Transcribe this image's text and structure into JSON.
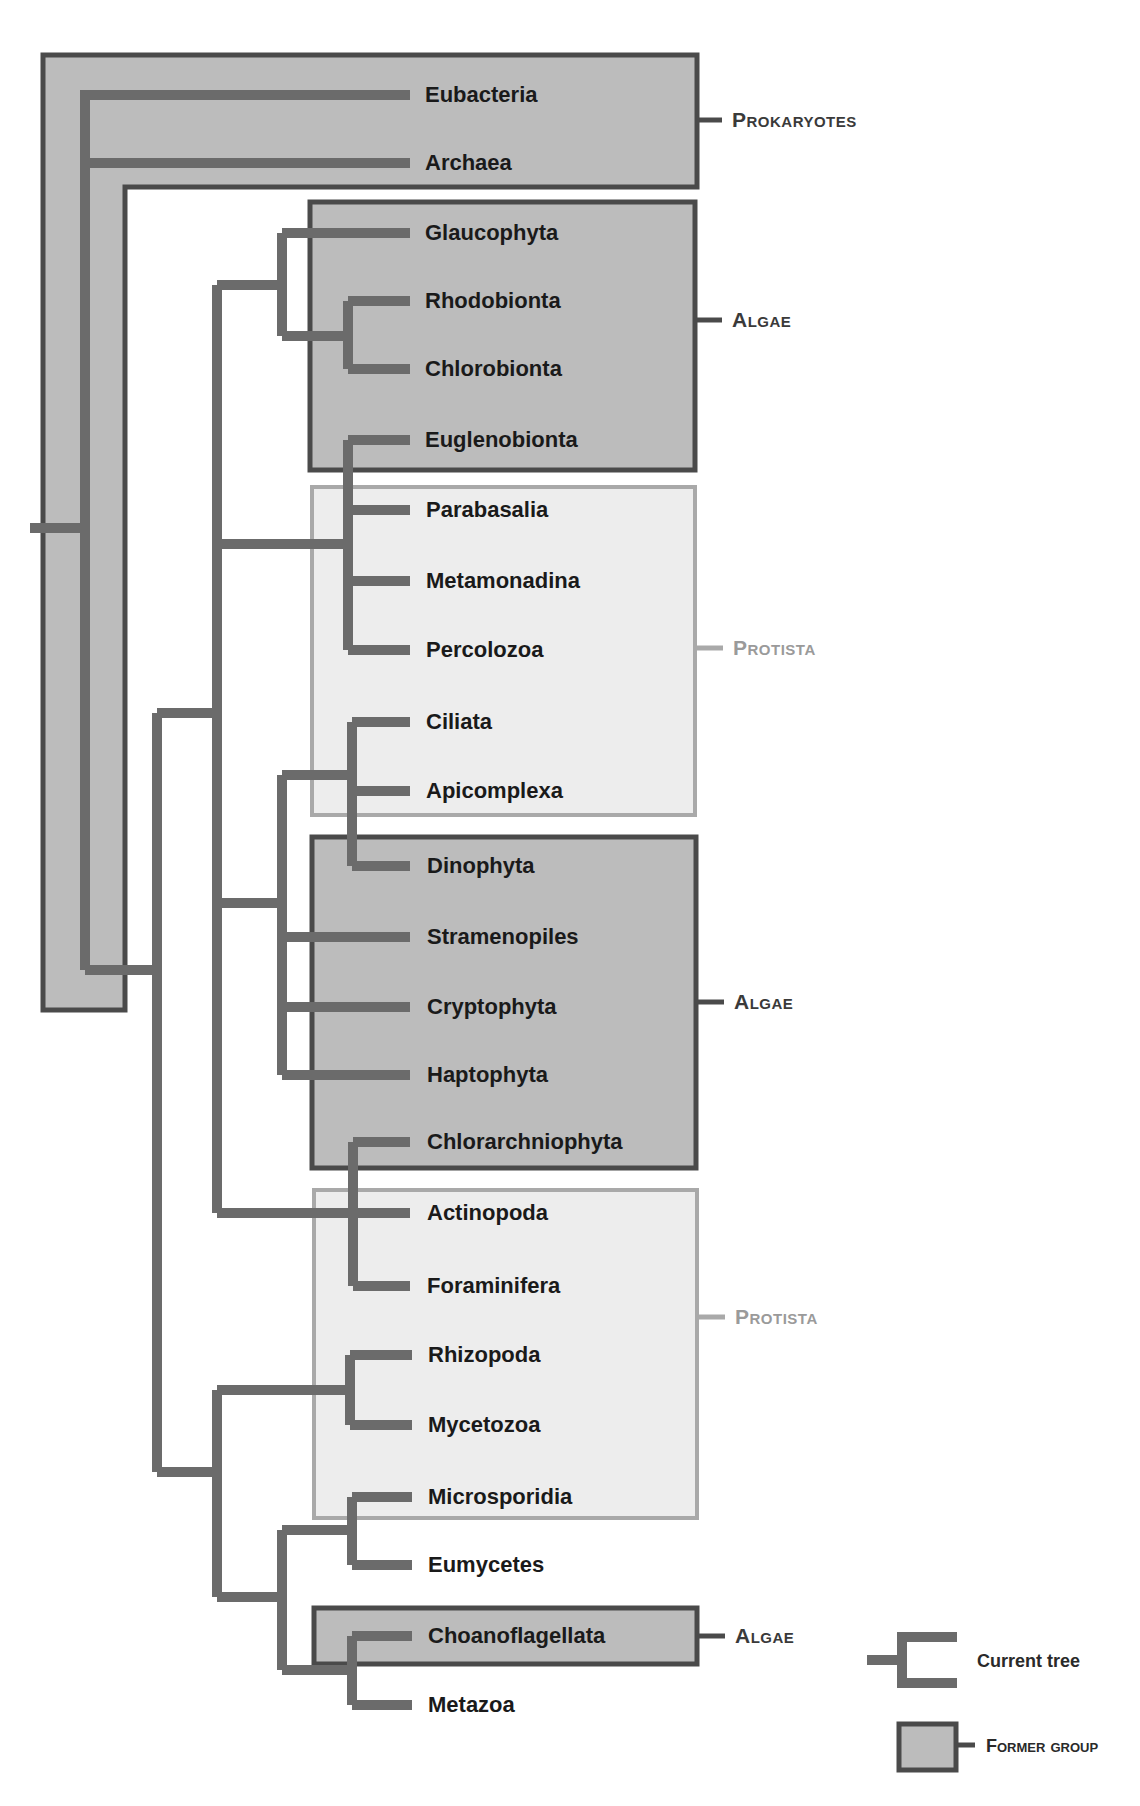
{
  "diagram": {
    "type": "phylogenetic-tree",
    "colors": {
      "branch": "#6b6b6b",
      "former_group_fill": "#bcbcbc",
      "former_group_stroke": "#4a4a4a",
      "protista_fill": "#ededed",
      "protista_stroke": "#a9a9a9",
      "label_dark": "#1a1a1a",
      "group_label_dark": "#3a3a3a",
      "group_label_light": "#9a9a9a"
    },
    "leaves": [
      {
        "label": "Eubacteria",
        "y": 95
      },
      {
        "label": "Archaea",
        "y": 163
      },
      {
        "label": "Glaucophyta",
        "y": 233
      },
      {
        "label": "Rhodobionta",
        "y": 301
      },
      {
        "label": "Chlorobionta",
        "y": 369
      },
      {
        "label": "Euglenobionta",
        "y": 440
      },
      {
        "label": "Parabasalia",
        "y": 510
      },
      {
        "label": "Metamonadina",
        "y": 581
      },
      {
        "label": "Percolozoa",
        "y": 650
      },
      {
        "label": "Ciliata",
        "y": 722
      },
      {
        "label": "Apicomplexa",
        "y": 791
      },
      {
        "label": "Dinophyta",
        "y": 866
      },
      {
        "label": "Stramenopiles",
        "y": 937
      },
      {
        "label": "Cryptophyta",
        "y": 1007
      },
      {
        "label": "Haptophyta",
        "y": 1075
      },
      {
        "label": "Chlorarchniophyta",
        "y": 1142
      },
      {
        "label": "Actinopoda",
        "y": 1213
      },
      {
        "label": "Foraminifera",
        "y": 1286
      },
      {
        "label": "Rhizopoda",
        "y": 1355
      },
      {
        "label": "Mycetozoa",
        "y": 1425
      },
      {
        "label": "Microsporidia",
        "y": 1497
      },
      {
        "label": "Eumycetes",
        "y": 1565
      },
      {
        "label": "Choanoflagellata",
        "y": 1636
      },
      {
        "label": "Metazoa",
        "y": 1705
      }
    ],
    "groups": [
      {
        "label": "Prokaryotes",
        "style": "former",
        "label_y": 120
      },
      {
        "label": "Algae",
        "style": "former",
        "label_y": 320
      },
      {
        "label": "Protista",
        "style": "protista",
        "label_y": 648
      },
      {
        "label": "Algae",
        "style": "former",
        "label_y": 1002
      },
      {
        "label": "Protista",
        "style": "protista",
        "label_y": 1317
      },
      {
        "label": "Algae",
        "style": "former",
        "label_y": 1636
      }
    ],
    "legend": {
      "current_tree": "Current tree",
      "former_group": "Former group"
    }
  }
}
